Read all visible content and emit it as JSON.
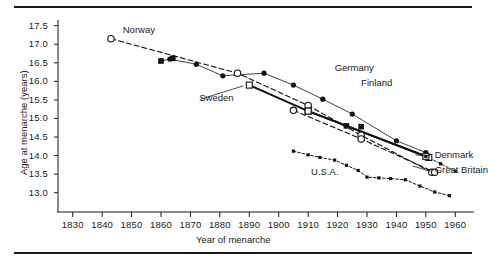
{
  "chart_data": {
    "type": "line",
    "title": "",
    "subtitle": "",
    "xlabel": "Year of menarche",
    "ylabel": "Age at menarche (years)",
    "xlim": [
      1825,
      1965
    ],
    "ylim": [
      12.75,
      17.6
    ],
    "xticks": [
      1830,
      1840,
      1850,
      1860,
      1870,
      1880,
      1890,
      1900,
      1910,
      1920,
      1930,
      1940,
      1950,
      1960
    ],
    "yticks": [
      13.0,
      13.5,
      14.0,
      14.5,
      15.0,
      15.5,
      16.0,
      16.5,
      17.0,
      17.5
    ],
    "xtick_labels": [
      "1830",
      "1840",
      "1850",
      "1860",
      "1870",
      "1880",
      "1890",
      "1900",
      "1910",
      "1920",
      "1930",
      "1940",
      "1950",
      "1960"
    ],
    "ytick_labels": [
      "13.0",
      "13.5",
      "14.0",
      "14.5",
      "15.0",
      "15.5",
      "16.0",
      "16.5",
      "17.0",
      "17.5"
    ],
    "grid": false,
    "legend_position": "inline-annotations",
    "series": [
      {
        "name": "Norway",
        "marker": "open-circle",
        "line": "dashed",
        "color": "#111111",
        "points": [
          [
            1843,
            17.15
          ],
          [
            1886,
            16.22
          ],
          [
            1910,
            15.35
          ],
          [
            1928,
            14.55
          ],
          [
            1952,
            13.55
          ]
        ]
      },
      {
        "name": "Finland",
        "marker": "filled-circle",
        "line": "solid-thin",
        "color": "#111111",
        "points": [
          [
            1860,
            16.55
          ],
          [
            1863,
            16.6
          ],
          [
            1872,
            16.46
          ],
          [
            1881,
            16.15
          ],
          [
            1895,
            16.22
          ],
          [
            1905,
            15.9
          ],
          [
            1915,
            15.52
          ],
          [
            1925,
            15.12
          ],
          [
            1940,
            14.4
          ],
          [
            1950,
            14.08
          ]
        ]
      },
      {
        "name": "Germany",
        "marker": "filled-square",
        "line": "none",
        "color": "#111111",
        "points": [
          [
            1860,
            16.55
          ],
          [
            1864,
            16.62
          ],
          [
            1923,
            14.8
          ],
          [
            1928,
            14.78
          ],
          [
            1951,
            13.95
          ]
        ]
      },
      {
        "name": "Sweden",
        "marker": "open-square",
        "line": "solid-thick",
        "color": "#111111",
        "points": [
          [
            1890,
            15.9
          ],
          [
            1910,
            15.2
          ],
          [
            1951,
            13.95
          ]
        ]
      },
      {
        "name": "Denmark",
        "marker": "open-square",
        "line": "solid-thick",
        "color": "#111111",
        "points": [
          [
            1910,
            15.2
          ],
          [
            1950,
            13.98
          ]
        ]
      },
      {
        "name": "Great Britain",
        "marker": "open-circle",
        "line": "dashed",
        "color": "#111111",
        "points": [
          [
            1905,
            15.22
          ],
          [
            1928,
            14.45
          ],
          [
            1953,
            13.55
          ]
        ]
      },
      {
        "name": "U.S.A.",
        "marker": "small-filled-square",
        "line": "dotted",
        "color": "#111111",
        "points": [
          [
            1905,
            14.12
          ],
          [
            1910,
            14.02
          ],
          [
            1914,
            13.95
          ],
          [
            1919,
            13.88
          ],
          [
            1923,
            13.74
          ],
          [
            1927,
            13.6
          ],
          [
            1930,
            13.42
          ],
          [
            1934,
            13.4
          ],
          [
            1938,
            13.38
          ],
          [
            1943,
            13.35
          ],
          [
            1948,
            13.18
          ],
          [
            1953,
            13.02
          ],
          [
            1958,
            12.92
          ]
        ]
      },
      {
        "name": "lower-tail-1",
        "marker": "small-filled-square",
        "line": "dotted",
        "color": "#111111",
        "points": [
          [
            1950,
            13.98
          ],
          [
            1955,
            13.78
          ],
          [
            1960,
            13.58
          ]
        ]
      }
    ],
    "annotations": [
      {
        "text": "Norway",
        "x": 1847,
        "y": 17.38
      },
      {
        "text": "Germany",
        "x": 1919,
        "y": 16.35
      },
      {
        "text": "Finland",
        "x": 1928,
        "y": 15.95
      },
      {
        "text": "Sweden",
        "x": 1873,
        "y": 15.55
      },
      {
        "text": "Denmark",
        "x": 1953,
        "y": 14.02
      },
      {
        "text": "Great Britain",
        "x": 1953,
        "y": 13.6
      },
      {
        "text": "U.S.A.",
        "x": 1911,
        "y": 13.55
      }
    ]
  },
  "axes": {
    "y_axis_name": "age-at-menarche-axis",
    "x_axis_name": "year-of-menarche-axis"
  }
}
